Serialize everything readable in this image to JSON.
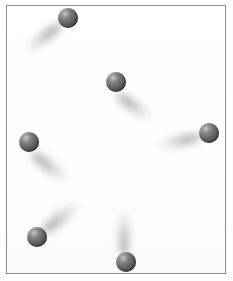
{
  "scene": {
    "title": "Shaded spheres with cast shadows",
    "canvas_width": 233,
    "canvas_height": 281,
    "background_color": "#fefefe",
    "border_color": "#8f9094",
    "sphere_color": "#646466",
    "sphere_highlight_color": "#b9b9bb",
    "shadow_color": "#5a5a5c",
    "object_count": 6,
    "arrangement": "ring"
  },
  "objects": [
    {
      "id": "sphere-top",
      "label": "Sphere 1",
      "cx": 68,
      "cy": 18,
      "diameter": 20,
      "shadow": {
        "length": 44,
        "thickness": 17,
        "angle_deg": 218,
        "offset_x": -24,
        "offset_y": 19
      }
    },
    {
      "id": "sphere-upper-middle",
      "label": "Sphere 2",
      "cx": 116,
      "cy": 82,
      "diameter": 20,
      "shadow": {
        "length": 42,
        "thickness": 17,
        "angle_deg": 325,
        "offset_x": 18,
        "offset_y": 24
      }
    },
    {
      "id": "sphere-left",
      "label": "Sphere 3",
      "cx": 29,
      "cy": 142,
      "diameter": 20,
      "shadow": {
        "length": 44,
        "thickness": 17,
        "angle_deg": 322,
        "offset_x": 20,
        "offset_y": 24
      }
    },
    {
      "id": "sphere-right",
      "label": "Sphere 4",
      "cx": 209,
      "cy": 133,
      "diameter": 20,
      "shadow": {
        "length": 44,
        "thickness": 16,
        "angle_deg": 192,
        "offset_x": -29,
        "offset_y": 8
      }
    },
    {
      "id": "sphere-bottom-left",
      "label": "Sphere 5",
      "cx": 37,
      "cy": 237,
      "diameter": 20,
      "shadow": {
        "length": 46,
        "thickness": 17,
        "angle_deg": 38,
        "offset_x": 23,
        "offset_y": -19
      }
    },
    {
      "id": "sphere-bottom-middle",
      "label": "Sphere 6",
      "cx": 126,
      "cy": 262,
      "diameter": 20,
      "shadow": {
        "length": 48,
        "thickness": 15,
        "angle_deg": 90,
        "offset_x": -2,
        "offset_y": -29
      }
    }
  ]
}
